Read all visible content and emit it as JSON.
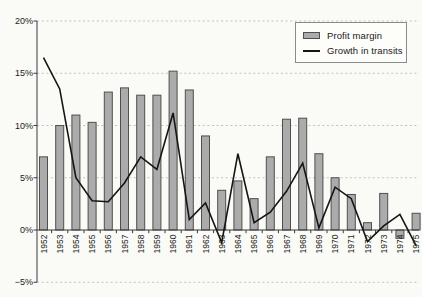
{
  "figure": {
    "background": "#fafaf6",
    "title": ""
  },
  "chart_data": {
    "type": "bar+line combo",
    "title": "",
    "xlabel": "",
    "ylabel": "",
    "categories": [
      "1952",
      "1953",
      "1954",
      "1955",
      "1956",
      "1957",
      "1958",
      "1959",
      "1960",
      "1961",
      "1962",
      "1963",
      "1964",
      "1965",
      "1966",
      "1967",
      "1968",
      "1969",
      "1970",
      "1971",
      "1972",
      "1973",
      "1974",
      "1975"
    ],
    "series": [
      {
        "name": "Profit margin",
        "type": "bar",
        "unit": "%",
        "fill": "#ababab",
        "border": "#4f4f4f",
        "values": [
          7.0,
          10.0,
          11.0,
          10.3,
          13.2,
          13.6,
          12.9,
          12.9,
          15.2,
          13.4,
          9.0,
          3.8,
          4.7,
          3.0,
          7.0,
          10.6,
          10.7,
          7.3,
          5.0,
          3.4,
          0.7,
          3.5,
          -0.8,
          1.6
        ]
      },
      {
        "name": "Growth in transits",
        "type": "line",
        "unit": "%",
        "color": "#151515",
        "values": [
          16.5,
          13.5,
          5.0,
          2.8,
          2.7,
          4.5,
          7.0,
          5.8,
          11.2,
          1.0,
          2.6,
          -1.2,
          7.3,
          0.7,
          1.7,
          3.7,
          6.4,
          0.2,
          4.1,
          3.0,
          -1.1,
          0.4,
          1.5,
          -1.5
        ]
      }
    ],
    "y_axis": {
      "min": -5,
      "max": 20,
      "ticks": [
        {
          "label": "20%",
          "value": 20
        },
        {
          "label": "15%",
          "value": 15
        },
        {
          "label": "10%",
          "value": 10
        },
        {
          "label": "5%",
          "value": 5
        },
        {
          "label": "0%",
          "value": 0
        },
        {
          "label": "−5%",
          "value": -5
        }
      ]
    },
    "x_axis": {
      "label_rotation_deg": -90,
      "baseline_value": 0
    },
    "grid": {
      "visible": true,
      "style": "dashed",
      "color": "#c6c6c6"
    },
    "axis_color": "#3a3a3a",
    "text_color": "#1a1a1a",
    "legend": {
      "position": "top-right",
      "border_color": "#8a8a8a",
      "items": [
        "Profit margin",
        "Growth in transits"
      ]
    }
  }
}
